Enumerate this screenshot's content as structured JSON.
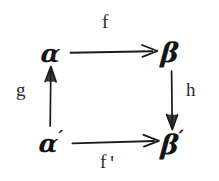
{
  "diagram": {
    "kind": "commutative-square",
    "ink_color": "#141414",
    "background_color": "#ffffff",
    "nodes": [
      {
        "id": "alpha",
        "label": "α",
        "prime": "",
        "position": "top-left"
      },
      {
        "id": "beta",
        "label": "β",
        "prime": "",
        "position": "top-right"
      },
      {
        "id": "alpha_prime",
        "label": "α",
        "prime": "′",
        "position": "bottom-left"
      },
      {
        "id": "beta_prime",
        "label": "β",
        "prime": "′",
        "position": "bottom-right"
      }
    ],
    "edges": [
      {
        "id": "f",
        "label": "f",
        "prime": "",
        "from": "alpha",
        "to": "beta",
        "direction": "right",
        "label_position": "top"
      },
      {
        "id": "g",
        "label": "g",
        "prime": "",
        "from": "alpha_prime",
        "to": "alpha",
        "direction": "up",
        "label_position": "left"
      },
      {
        "id": "h",
        "label": "h",
        "prime": "",
        "from": "beta",
        "to": "beta_prime",
        "direction": "down",
        "label_position": "right"
      },
      {
        "id": "f_prime",
        "label": "f",
        "prime": "'",
        "from": "alpha_prime",
        "to": "beta_prime",
        "direction": "right",
        "label_position": "bottom"
      }
    ]
  }
}
